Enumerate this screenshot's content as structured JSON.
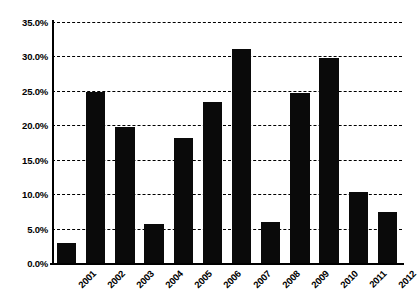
{
  "chart_data": {
    "type": "bar",
    "title": "",
    "subtitle": "",
    "xlabel": "",
    "ylabel": "",
    "categories": [
      "2001",
      "2002",
      "2003",
      "2004",
      "2005",
      "2006",
      "2007",
      "2008",
      "2009",
      "2010",
      "2011",
      "2012"
    ],
    "values": [
      2.9,
      24.8,
      19.7,
      5.6,
      18.2,
      23.4,
      31.1,
      6.0,
      24.7,
      29.8,
      10.3,
      7.4
    ],
    "value_labels": [
      "2.9%",
      "24.8%",
      "19.7%",
      "5.6%",
      "18.2%",
      "23.4%",
      "31.1%",
      "6.0%",
      "24.7%",
      "29.8%",
      "10.3%",
      "7.4%"
    ],
    "ylim": [
      0,
      35
    ],
    "ytick_values": [
      0,
      5,
      10,
      15,
      20,
      25,
      30,
      35
    ],
    "ytick_labels": [
      "0.0%",
      "5.0%",
      "10.0%",
      "15.0%",
      "20.0%",
      "25.0%",
      "30.0%",
      "35.0%"
    ],
    "grid": true,
    "grid_style": "dashed",
    "grid_axis": "y",
    "legend": false,
    "legend_position": "none",
    "bar_color": "#0a0a0a",
    "background_color": "#ffffff",
    "axis_color": "#000000",
    "xtick_label_rotation": -45
  }
}
